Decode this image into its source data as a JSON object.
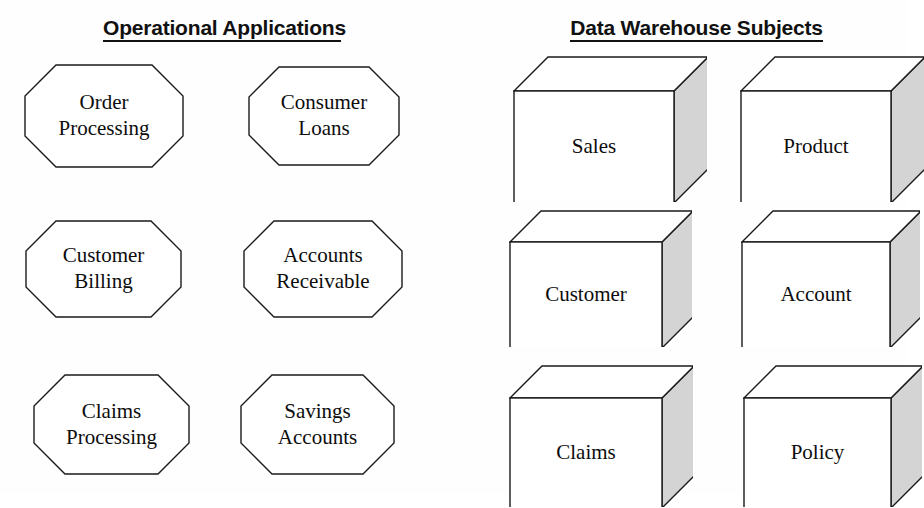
{
  "diagram": {
    "background_color": "#fefefe",
    "line_color": "#1a1a1a",
    "cube_side_fill": "#d4d4d4",
    "cube_face_fill": "#ffffff",
    "octagon_fill": "#ffffff"
  },
  "columns": [
    {
      "id": "operational-applications",
      "header": "Operational Applications",
      "shape": "octagon",
      "items": [
        {
          "id": "order-processing",
          "line1": "Order",
          "line2": "Processing",
          "x": 24,
          "y": 64,
          "w": 160,
          "h": 104,
          "cut": 32
        },
        {
          "id": "consumer-loans",
          "line1": "Consumer",
          "line2": "Loans",
          "x": 248,
          "y": 66,
          "w": 152,
          "h": 100,
          "cut": 31
        },
        {
          "id": "customer-billing",
          "line1": "Customer",
          "line2": "Billing",
          "x": 25,
          "y": 220,
          "w": 157,
          "h": 98,
          "cut": 31
        },
        {
          "id": "accounts-receivable",
          "line1": "Accounts",
          "line2": "Receivable",
          "x": 243,
          "y": 220,
          "w": 160,
          "h": 98,
          "cut": 31
        },
        {
          "id": "claims-processing",
          "line1": "Claims",
          "line2": "Processing",
          "x": 33,
          "y": 374,
          "w": 157,
          "h": 101,
          "cut": 32
        },
        {
          "id": "savings-accounts",
          "line1": "Savings",
          "line2": "Accounts",
          "x": 240,
          "y": 374,
          "w": 155,
          "h": 101,
          "cut": 32
        }
      ]
    },
    {
      "id": "data-warehouse-subjects",
      "header": "Data Warehouse Subjects",
      "shape": "cube",
      "items": [
        {
          "id": "sales",
          "label": "Sales",
          "x": 513,
          "y": 56,
          "w": 160,
          "h": 112,
          "depth": 34
        },
        {
          "id": "product",
          "label": "Product",
          "x": 740,
          "y": 56,
          "w": 150,
          "h": 112,
          "depth": 34
        },
        {
          "id": "customer",
          "label": "Customer",
          "x": 509,
          "y": 210,
          "w": 152,
          "h": 106,
          "depth": 31
        },
        {
          "id": "account",
          "label": "Account",
          "x": 741,
          "y": 210,
          "w": 148,
          "h": 106,
          "depth": 31
        },
        {
          "id": "claims",
          "label": "Claims",
          "x": 509,
          "y": 365,
          "w": 152,
          "h": 110,
          "depth": 32
        },
        {
          "id": "policy",
          "label": "Policy",
          "x": 743,
          "y": 365,
          "w": 147,
          "h": 110,
          "depth": 32
        }
      ]
    }
  ]
}
